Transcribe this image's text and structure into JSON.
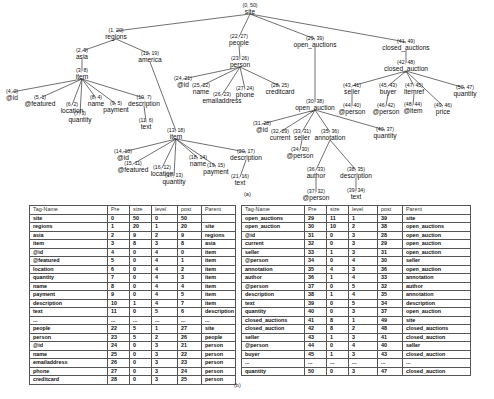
{
  "tree": {
    "caption": "(a)",
    "nodes": [
      {
        "id": "site",
        "label": "site",
        "pp": "(0, 50)",
        "parent": null
      },
      {
        "id": "regions",
        "label": "regions",
        "pp": "(1, 20)",
        "parent": "site"
      },
      {
        "id": "asia",
        "label": "asia",
        "pp": "(2, 9)",
        "parent": "regions"
      },
      {
        "id": "item1",
        "label": "item",
        "pp": "(3, 8)",
        "parent": "asia"
      },
      {
        "id": "id1",
        "label": "@id",
        "pp": "(4, 0)",
        "parent": "item1"
      },
      {
        "id": "feat1",
        "label": "@featured",
        "pp": "(5, 1)",
        "parent": "item1"
      },
      {
        "id": "loc1",
        "label": "location",
        "pp": "(6, 2)",
        "parent": "item1"
      },
      {
        "id": "qty1",
        "label": "quantity",
        "pp": "(7, 3)",
        "parent": "item1"
      },
      {
        "id": "name1",
        "label": "name",
        "pp": "(8, 4)",
        "parent": "item1"
      },
      {
        "id": "pay1",
        "label": "payment",
        "pp": "(9, 5)",
        "parent": "item1"
      },
      {
        "id": "desc1",
        "label": "description",
        "pp": "(10, 7)",
        "parent": "item1"
      },
      {
        "id": "text1",
        "label": "text",
        "pp": "(11, 6)",
        "parent": "desc1"
      },
      {
        "id": "america",
        "label": "america",
        "pp": "(12, 19)",
        "parent": "regions"
      },
      {
        "id": "item2",
        "label": "item",
        "pp": "(13, 18)",
        "parent": "america"
      },
      {
        "id": "id2",
        "label": "@id",
        "pp": "(14, 10)",
        "parent": "item2"
      },
      {
        "id": "feat2",
        "label": "@featured",
        "pp": "(15, 11)",
        "parent": "item2"
      },
      {
        "id": "loc2",
        "label": "location",
        "pp": "(16, 12)",
        "parent": "item2"
      },
      {
        "id": "qty2",
        "label": "quantity",
        "pp": "(17, 13)",
        "parent": "item2"
      },
      {
        "id": "name2",
        "label": "name",
        "pp": "(18, 14)",
        "parent": "item2"
      },
      {
        "id": "pay2",
        "label": "payment",
        "pp": "(19, 15)",
        "parent": "item2"
      },
      {
        "id": "desc2",
        "label": "description",
        "pp": "(20, 17)",
        "parent": "item2"
      },
      {
        "id": "text2",
        "label": "text",
        "pp": "(21, 16)",
        "parent": "desc2"
      },
      {
        "id": "people",
        "label": "people",
        "pp": "(22, 27)",
        "parent": "site"
      },
      {
        "id": "person",
        "label": "person",
        "pp": "(23, 26)",
        "parent": "people"
      },
      {
        "id": "id3",
        "label": "@id",
        "pp": "(24, 21)",
        "parent": "person"
      },
      {
        "id": "pname",
        "label": "name",
        "pp": "(25, 22)",
        "parent": "person"
      },
      {
        "id": "email",
        "label": "emailaddress",
        "pp": "(26, 23)",
        "parent": "person"
      },
      {
        "id": "phone",
        "label": "phone",
        "pp": "(27, 24)",
        "parent": "person"
      },
      {
        "id": "cc",
        "label": "creditcard",
        "pp": "(28, 25)",
        "parent": "person"
      },
      {
        "id": "oas",
        "label": "open_auctions",
        "pp": "(29, 39)",
        "parent": "site"
      },
      {
        "id": "oa",
        "label": "open_auction",
        "pp": "(30, 38)",
        "parent": "oas"
      },
      {
        "id": "id4",
        "label": "@id",
        "pp": "(31, 28)",
        "parent": "oa"
      },
      {
        "id": "cur",
        "label": "current",
        "pp": "(32, 29)",
        "parent": "oa"
      },
      {
        "id": "seller1",
        "label": "seller",
        "pp": "(33, 31)",
        "parent": "oa"
      },
      {
        "id": "sp1",
        "label": "@person",
        "pp": "(34, 30)",
        "parent": "seller1"
      },
      {
        "id": "annot",
        "label": "annotation",
        "pp": "(35, 36)",
        "parent": "oa"
      },
      {
        "id": "author",
        "label": "author",
        "pp": "(36, 33)",
        "parent": "annot"
      },
      {
        "id": "ap",
        "label": "@person",
        "pp": "(37, 32)",
        "parent": "author"
      },
      {
        "id": "desc3",
        "label": "description",
        "pp": "(38, 35)",
        "parent": "annot"
      },
      {
        "id": "text3",
        "label": "text",
        "pp": "(39, 34)",
        "parent": "desc3"
      },
      {
        "id": "qty3",
        "label": "quantity",
        "pp": "(40, 37)",
        "parent": "oa"
      },
      {
        "id": "cas",
        "label": "closed_auctions",
        "pp": "(41, 49)",
        "parent": "site"
      },
      {
        "id": "ca",
        "label": "closed_auction",
        "pp": "(42, 48)",
        "parent": "cas"
      },
      {
        "id": "seller2",
        "label": "seller",
        "pp": "(43, 41)",
        "parent": "ca"
      },
      {
        "id": "sp2",
        "label": "@person",
        "pp": "(44, 40)",
        "parent": "seller2"
      },
      {
        "id": "buyer",
        "label": "buyer",
        "pp": "(45, 43)",
        "parent": "ca"
      },
      {
        "id": "bp",
        "label": "@person",
        "pp": "(46, 42)",
        "parent": "buyer"
      },
      {
        "id": "itemref",
        "label": "itemref",
        "pp": "(47, 45)",
        "parent": "ca"
      },
      {
        "id": "ii",
        "label": "@item",
        "pp": "(48, 44)",
        "parent": "itemref"
      },
      {
        "id": "price",
        "label": "price",
        "pp": "(49, 46)",
        "parent": "ca"
      },
      {
        "id": "qty4",
        "label": "quantity",
        "pp": "(50, 47)",
        "parent": "ca"
      }
    ]
  },
  "tables": {
    "caption": "(b)",
    "headers": [
      "Tag-Name",
      "Pre",
      "size",
      "level",
      "post",
      "Parent"
    ],
    "left": [
      [
        "site",
        "0",
        "50",
        "0",
        "50",
        ""
      ],
      [
        "regions",
        "1",
        "20",
        "1",
        "20",
        "site"
      ],
      [
        "asia",
        "2",
        "9",
        "2",
        "9",
        "regions"
      ],
      [
        "item",
        "3",
        "8",
        "3",
        "8",
        "asia"
      ],
      [
        "@id",
        "4",
        "0",
        "4",
        "0",
        "item"
      ],
      [
        "@featured",
        "5",
        "0",
        "4",
        "1",
        "item"
      ],
      [
        "location",
        "6",
        "0",
        "4",
        "2",
        "item"
      ],
      [
        "quantity",
        "7",
        "0",
        "4",
        "3",
        "item"
      ],
      [
        "name",
        "8",
        "0",
        "4",
        "4",
        "item"
      ],
      [
        "payment",
        "9",
        "0",
        "4",
        "5",
        "item"
      ],
      [
        "description",
        "10",
        "1",
        "4",
        "7",
        "item"
      ],
      [
        "text",
        "11",
        "0",
        "5",
        "6",
        "description"
      ],
      [
        "...",
        "...",
        "...",
        "...",
        "...",
        "..."
      ],
      [
        "people",
        "22",
        "5",
        "1",
        "27",
        "site"
      ],
      [
        "person",
        "23",
        "5",
        "2",
        "26",
        "people"
      ],
      [
        "@id",
        "24",
        "0",
        "3",
        "21",
        "person"
      ],
      [
        "name",
        "25",
        "0",
        "3",
        "22",
        "person"
      ],
      [
        "emailaddress",
        "26",
        "0",
        "3",
        "23",
        "person"
      ],
      [
        "phone",
        "27",
        "0",
        "3",
        "24",
        "person"
      ],
      [
        "creditcard",
        "28",
        "0",
        "3",
        "25",
        "person"
      ]
    ],
    "right": [
      [
        "open_auctions",
        "29",
        "11",
        "1",
        "39",
        "site"
      ],
      [
        "open_auction",
        "30",
        "10",
        "2",
        "38",
        "open_auctions"
      ],
      [
        "@id",
        "31",
        "0",
        "3",
        "28",
        "open_auction"
      ],
      [
        "current",
        "32",
        "0",
        "3",
        "29",
        "open_auction"
      ],
      [
        "seller",
        "33",
        "1",
        "3",
        "31",
        "open_auction"
      ],
      [
        "@person",
        "34",
        "0",
        "4",
        "30",
        "seller"
      ],
      [
        "annotation",
        "35",
        "4",
        "3",
        "36",
        "open_auction"
      ],
      [
        "author",
        "36",
        "1",
        "4",
        "33",
        "annotation"
      ],
      [
        "@person",
        "37",
        "0",
        "5",
        "32",
        "author"
      ],
      [
        "description",
        "38",
        "1",
        "4",
        "35",
        "annotation"
      ],
      [
        "text",
        "39",
        "0",
        "5",
        "34",
        "description"
      ],
      [
        "quantity",
        "40",
        "0",
        "3",
        "37",
        "open_auction"
      ],
      [
        "closed_auctions",
        "41",
        "8",
        "1",
        "49",
        "site"
      ],
      [
        "closed_auction",
        "42",
        "8",
        "2",
        "48",
        "closed_auctions"
      ],
      [
        "seller",
        "43",
        "1",
        "3",
        "41",
        "closed_auction"
      ],
      [
        "@person",
        "44",
        "0",
        "4",
        "40",
        "seller"
      ],
      [
        "buyer",
        "45",
        "1",
        "3",
        "43",
        "closed_auction"
      ],
      [
        "...",
        "...",
        "...",
        "...",
        "...",
        "..."
      ],
      [
        "quantity",
        "50",
        "0",
        "3",
        "47",
        "closed_auction"
      ]
    ]
  }
}
